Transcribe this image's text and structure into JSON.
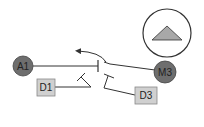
{
  "diagram": {
    "nodes": {
      "a1": {
        "label": "A1",
        "shape": "circle",
        "fill": "#6e6e6e"
      },
      "m3": {
        "label": "M3",
        "shape": "circle",
        "fill": "#6e6e6e"
      },
      "d1": {
        "label": "D1",
        "shape": "square",
        "fill": "#d0d0d0"
      },
      "d3": {
        "label": "D3",
        "shape": "square",
        "fill": "#d0d0d0"
      }
    },
    "compass": {
      "icon": "triangle-up-icon",
      "fill": "#a8a8a8"
    },
    "colors": {
      "line": "#333333",
      "circle_fill": "#6e6e6e",
      "box_fill": "#d0d0d0",
      "box_stroke": "#888888"
    }
  }
}
